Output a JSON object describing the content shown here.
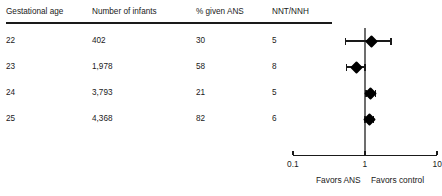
{
  "table": {
    "columns": [
      {
        "key": "gestational_age",
        "label": "Gestational age"
      },
      {
        "key": "number_of_infants",
        "label": "Number of infants"
      },
      {
        "key": "percent_given_ans",
        "label": "% given ANS"
      },
      {
        "key": "nnt_nnh",
        "label": "NNT/NNH"
      }
    ],
    "rows": [
      {
        "gestational_age": "22",
        "number_of_infants": "402",
        "percent_given_ans": "30",
        "nnt_nnh": "5"
      },
      {
        "gestational_age": "23",
        "number_of_infants": "1,978",
        "percent_given_ans": "58",
        "nnt_nnh": "8"
      },
      {
        "gestational_age": "24",
        "number_of_infants": "3,793",
        "percent_given_ans": "21",
        "nnt_nnh": "5"
      },
      {
        "gestational_age": "25",
        "number_of_infants": "4,368",
        "percent_given_ans": "82",
        "nnt_nnh": "6"
      }
    ]
  },
  "chart_data": {
    "type": "scatter",
    "title": "",
    "xlabel": "",
    "ylabel": "",
    "scale": "log",
    "xlim": [
      0.1,
      10
    ],
    "grid": false,
    "reference_line": 1,
    "tick_labels": [
      "0.1",
      "1",
      "10"
    ],
    "tick_values": [
      0.1,
      1,
      10
    ],
    "left_annotation": "Favors ANS",
    "right_annotation": "Favors control",
    "categories": [
      "22",
      "23",
      "24",
      "25"
    ],
    "series": [
      {
        "name": "Odds ratio",
        "points": [
          {
            "category": "22",
            "estimate": 1.25,
            "ci_low": 0.54,
            "ci_high": 2.3
          },
          {
            "category": "23",
            "estimate": 0.77,
            "ci_low": 0.56,
            "ci_high": 1.0
          },
          {
            "category": "24",
            "estimate": 1.2,
            "ci_low": 1.03,
            "ci_high": 1.4
          },
          {
            "category": "25",
            "estimate": 1.14,
            "ci_low": 1.0,
            "ci_high": 1.3
          }
        ]
      }
    ]
  },
  "axis": {
    "tick_low": "0.1",
    "tick_mid": "1",
    "tick_high": "10",
    "favors_left": "Favors ANS",
    "favors_right": "Favors control"
  }
}
